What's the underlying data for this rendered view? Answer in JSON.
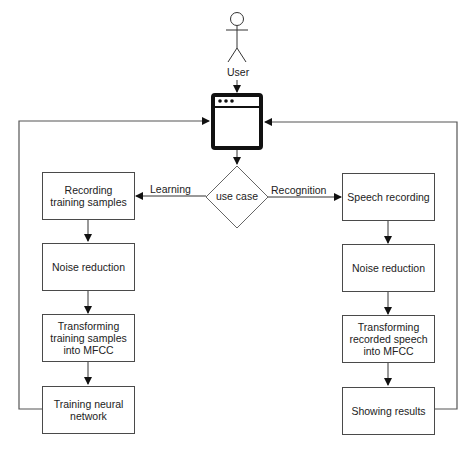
{
  "actor": {
    "label": "User"
  },
  "decision": {
    "label": "use case"
  },
  "branches": {
    "left_label": "Learning",
    "right_label": "Recognition"
  },
  "learning_steps": [
    {
      "label": "Recording training samples"
    },
    {
      "label": "Noise reduction"
    },
    {
      "label": "Transforming training samples into MFCC"
    },
    {
      "label": "Training neural network"
    }
  ],
  "recognition_steps": [
    {
      "label": "Speech recording"
    },
    {
      "label": "Noise reduction"
    },
    {
      "label": "Transforming recorded speech into MFCC"
    },
    {
      "label": "Showing results"
    }
  ],
  "icons": {
    "app": "browser-window-icon",
    "actor": "stick-figure-icon"
  },
  "colors": {
    "line": "#4a4a4a",
    "icon": "#111111"
  }
}
